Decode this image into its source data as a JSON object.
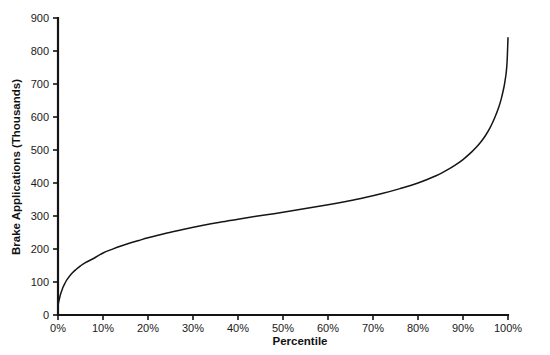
{
  "chart_data": {
    "type": "line",
    "title": "",
    "xlabel": "Percentile",
    "ylabel": "Brake Applications (Thousands)",
    "xlim": [
      0,
      100
    ],
    "ylim": [
      0,
      900
    ],
    "grid": false,
    "legend": false,
    "x_tick_labels": [
      "0%",
      "10%",
      "20%",
      "30%",
      "40%",
      "50%",
      "60%",
      "70%",
      "80%",
      "90%",
      "100%"
    ],
    "x_tick_values": [
      0,
      10,
      20,
      30,
      40,
      50,
      60,
      70,
      80,
      90,
      100
    ],
    "y_tick_labels": [
      "0",
      "100",
      "200",
      "300",
      "400",
      "500",
      "600",
      "700",
      "800",
      "900"
    ],
    "y_tick_values": [
      0,
      100,
      200,
      300,
      400,
      500,
      600,
      700,
      800,
      900
    ],
    "series": [
      {
        "name": "Brake Applications",
        "color": "#151515",
        "x": [
          0,
          0.5,
          1,
          1.5,
          2,
          3,
          4,
          5,
          6,
          8,
          10,
          12,
          14,
          16,
          18,
          20,
          24,
          28,
          32,
          36,
          40,
          44,
          48,
          52,
          56,
          60,
          64,
          68,
          72,
          76,
          80,
          84,
          86,
          88,
          90,
          92,
          93,
          94,
          95,
          96,
          97,
          98,
          98.5,
          99,
          99.3,
          99.6,
          99.8,
          100
        ],
        "y": [
          30,
          60,
          80,
          95,
          107,
          125,
          138,
          149,
          158,
          172,
          188,
          199,
          209,
          218,
          226,
          234,
          248,
          260,
          271,
          281,
          290,
          299,
          307,
          316,
          325,
          334,
          344,
          355,
          368,
          383,
          400,
          422,
          436,
          452,
          471,
          495,
          509,
          525,
          544,
          567,
          596,
          632,
          655,
          684,
          706,
          734,
          768,
          840
        ]
      }
    ],
    "axis_color": "#141414",
    "background_color": "#ffffff"
  },
  "layout": {
    "plot_left_px": 58,
    "plot_right_px": 508,
    "plot_top_px": 18,
    "plot_bottom_px": 315
  }
}
